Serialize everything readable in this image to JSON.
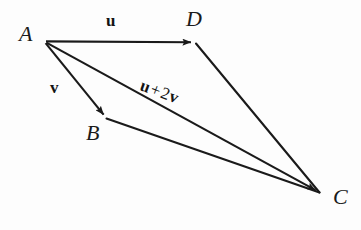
{
  "figure": {
    "background_color": "#fdfdfd",
    "stroke_color": "#1a1a1a",
    "width": 361,
    "height": 230
  },
  "points": [
    {
      "id": "A",
      "label": "A",
      "x": 44,
      "y": 41,
      "label_x": 19,
      "label_y": 23
    },
    {
      "id": "B",
      "label": "B",
      "x": 107,
      "y": 119,
      "label_x": 86,
      "label_y": 122
    },
    {
      "id": "C",
      "label": "C",
      "x": 320,
      "y": 193,
      "label_x": 333,
      "label_y": 186
    },
    {
      "id": "D",
      "label": "D",
      "x": 196,
      "y": 43,
      "label_x": 186,
      "label_y": 8
    }
  ],
  "vectors": [
    {
      "id": "u",
      "from": "A",
      "to": "D",
      "label": "u",
      "arrow": true,
      "label_x": 106,
      "label_y": 12
    },
    {
      "id": "v",
      "from": "A",
      "to": "B",
      "label": "v",
      "arrow": true,
      "label_x": 50,
      "label_y": 79
    },
    {
      "id": "u_plus_2v",
      "from": "A",
      "to": "C",
      "arrow": true,
      "label_x": 141,
      "label_y": 76
    }
  ],
  "segments": [
    {
      "id": "DC",
      "from": "D",
      "to": "C",
      "arrow": false
    },
    {
      "id": "BC",
      "from": "B",
      "to": "C",
      "arrow": false
    }
  ],
  "labels": {
    "u": "u",
    "v": "v",
    "sum_vector_1": "u",
    "sum_operator": "+",
    "sum_coefficient": "2",
    "sum_vector_2": "v",
    "point_a": "A",
    "point_b": "B",
    "point_c": "C",
    "point_d": "D"
  }
}
